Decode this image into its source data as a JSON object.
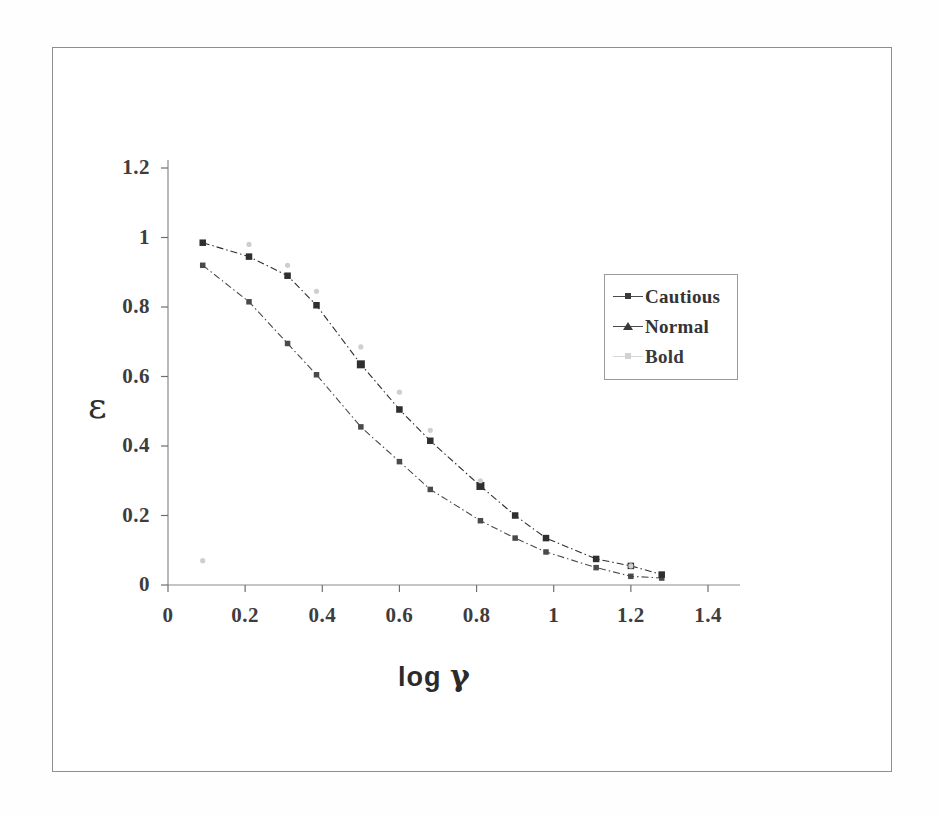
{
  "figure": {
    "y_axis_label": "ε",
    "x_axis_label_text": "log",
    "x_axis_label_symbol": "γ"
  },
  "legend": {
    "entries": [
      {
        "label": "Cautious",
        "marker": "small-square",
        "color": "#4a4a4a"
      },
      {
        "label": "Normal",
        "marker": "triangle",
        "color": "#3a3a3a"
      },
      {
        "label": "Bold",
        "marker": "faint-dot",
        "color": "#d2d2d2"
      }
    ]
  },
  "axes": {
    "x_ticks": [
      "0",
      "0.2",
      "0.4",
      "0.6",
      "0.8",
      "1",
      "1.2",
      "1.4"
    ],
    "y_ticks": [
      "0",
      "0.2",
      "0.4",
      "0.6",
      "0.8",
      "1",
      "1.2"
    ]
  },
  "chart_data": {
    "type": "line",
    "title": "",
    "subtitle": "",
    "xlabel": "log γ",
    "ylabel": "ε",
    "xlim": [
      0,
      1.4
    ],
    "ylim": [
      0,
      1.2
    ],
    "x_ticks": [
      0,
      0.2,
      0.4,
      0.6,
      0.8,
      1.0,
      1.2,
      1.4
    ],
    "y_ticks": [
      0,
      0.2,
      0.4,
      0.6,
      0.8,
      1.0,
      1.2
    ],
    "grid": false,
    "legend_position": "upper-right-inside",
    "series": [
      {
        "name": "Cautious",
        "marker": "small-square",
        "color": "#4a4a4a",
        "line_style": "dash-dot",
        "points": [
          [
            0.09,
            0.92
          ],
          [
            0.21,
            0.815
          ],
          [
            0.31,
            0.695
          ],
          [
            0.385,
            0.605
          ],
          [
            0.5,
            0.455
          ],
          [
            0.6,
            0.355
          ],
          [
            0.68,
            0.275
          ],
          [
            0.81,
            0.185
          ],
          [
            0.9,
            0.135
          ],
          [
            0.98,
            0.095
          ],
          [
            1.11,
            0.05
          ],
          [
            1.2,
            0.025
          ],
          [
            1.28,
            0.02
          ]
        ]
      },
      {
        "name": "Normal",
        "marker": "square",
        "color": "#2f2f2f",
        "line_style": "dash-dot",
        "points": [
          [
            0.09,
            0.985
          ],
          [
            0.21,
            0.945
          ],
          [
            0.31,
            0.89
          ],
          [
            0.385,
            0.805
          ],
          [
            0.5,
            0.635
          ],
          [
            0.6,
            0.505
          ],
          [
            0.68,
            0.415
          ],
          [
            0.81,
            0.285
          ],
          [
            0.9,
            0.2
          ],
          [
            0.98,
            0.135
          ],
          [
            1.11,
            0.075
          ],
          [
            1.2,
            0.055
          ],
          [
            1.28,
            0.03
          ]
        ]
      },
      {
        "name": "Bold",
        "marker": "faint-dot",
        "color": "#cfcfcf",
        "line_style": "none",
        "points": [
          [
            0.09,
            0.07
          ],
          [
            0.21,
            0.98
          ],
          [
            0.31,
            0.92
          ],
          [
            0.385,
            0.845
          ],
          [
            0.5,
            0.685
          ],
          [
            0.6,
            0.555
          ],
          [
            0.68,
            0.445
          ],
          [
            0.81,
            0.3
          ],
          [
            1.2,
            0.055
          ]
        ]
      }
    ]
  }
}
